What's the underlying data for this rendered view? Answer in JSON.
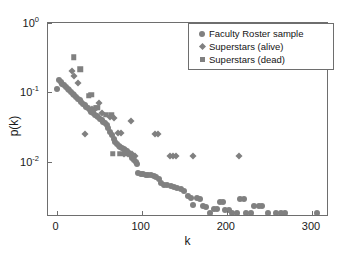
{
  "chart_data": {
    "type": "scatter",
    "title": "",
    "xlabel": "k",
    "ylabel": "p(k)",
    "xscale": "linear",
    "yscale": "log",
    "xlim": [
      -10,
      320
    ],
    "ylim": [
      0.0016,
      1.0
    ],
    "grid": false,
    "legend_position": "top-right",
    "xticks": [
      0,
      100,
      200,
      300
    ],
    "xtick_labels": [
      "0",
      "100",
      "200",
      "300"
    ],
    "yticks": [
      1,
      0.1,
      0.01
    ],
    "ytick_labels": [
      "10",
      "10",
      "10"
    ],
    "ytick_exponents": [
      "0",
      "-1",
      "-2"
    ],
    "series": [
      {
        "name": "Faculty Roster sample",
        "marker": "circle",
        "color": "#808080",
        "points": [
          [
            1,
            0.112
          ],
          [
            3,
            0.15
          ],
          [
            5,
            0.139
          ],
          [
            7,
            0.132
          ],
          [
            9,
            0.127
          ],
          [
            11,
            0.12
          ],
          [
            13,
            0.113
          ],
          [
            15,
            0.107
          ],
          [
            17,
            0.101
          ],
          [
            19,
            0.096
          ],
          [
            21,
            0.091
          ],
          [
            23,
            0.086
          ],
          [
            25,
            0.081
          ],
          [
            27,
            0.077
          ],
          [
            29,
            0.073
          ],
          [
            31,
            0.069
          ],
          [
            33,
            0.066
          ],
          [
            35,
            0.062
          ],
          [
            37,
            0.059
          ],
          [
            39,
            0.056
          ],
          [
            41,
            0.053
          ],
          [
            43,
            0.051
          ],
          [
            45,
            0.048
          ],
          [
            47,
            0.046
          ],
          [
            49,
            0.044
          ],
          [
            51,
            0.042
          ],
          [
            53,
            0.04
          ],
          [
            55,
            0.038
          ],
          [
            57,
            0.036
          ],
          [
            59,
            0.034
          ],
          [
            61,
            0.031
          ],
          [
            63,
            0.027
          ],
          [
            65,
            0.024
          ],
          [
            67,
            0.021
          ],
          [
            69,
            0.019
          ],
          [
            71,
            0.018
          ],
          [
            73,
            0.017
          ],
          [
            75,
            0.0165
          ],
          [
            77,
            0.016
          ],
          [
            79,
            0.0155
          ],
          [
            81,
            0.015
          ],
          [
            83,
            0.0145
          ],
          [
            85,
            0.0135
          ],
          [
            87,
            0.0125
          ],
          [
            89,
            0.0115
          ],
          [
            91,
            0.0105
          ],
          [
            93,
            0.0098
          ],
          [
            95,
            0.0092
          ],
          [
            96,
            0.0068
          ],
          [
            99,
            0.0066
          ],
          [
            102,
            0.0066
          ],
          [
            105,
            0.0065
          ],
          [
            108,
            0.0065
          ],
          [
            111,
            0.0064
          ],
          [
            114,
            0.0063
          ],
          [
            117,
            0.006
          ],
          [
            120,
            0.0056
          ],
          [
            123,
            0.005
          ],
          [
            126,
            0.0047
          ],
          [
            130,
            0.0046
          ],
          [
            134,
            0.0045
          ],
          [
            138,
            0.0044
          ],
          [
            142,
            0.0042
          ],
          [
            146,
            0.004
          ],
          [
            150,
            0.0038
          ],
          [
            154,
            0.0032
          ],
          [
            158,
            0.003
          ],
          [
            160,
            0.0024
          ],
          [
            165,
            0.003
          ],
          [
            168,
            0.0029
          ],
          [
            172,
            0.0023
          ],
          [
            176,
            0.0022
          ],
          [
            180,
            0.0018
          ],
          [
            185,
            0.0021
          ],
          [
            188,
            0.0021
          ],
          [
            192,
            0.0026
          ],
          [
            195,
            0.0026
          ],
          [
            198,
            0.002
          ],
          [
            202,
            0.002
          ],
          [
            206,
            0.0018
          ],
          [
            212,
            0.0018
          ],
          [
            216,
            0.0029
          ],
          [
            220,
            0.0029
          ],
          [
            222,
            0.0018
          ],
          [
            228,
            0.0018
          ],
          [
            232,
            0.0023
          ],
          [
            238,
            0.0023
          ],
          [
            241,
            0.0023
          ],
          [
            248,
            0.0018
          ],
          [
            258,
            0.0018
          ],
          [
            264,
            0.0018
          ],
          [
            268,
            0.0018
          ],
          [
            306,
            0.0018
          ]
        ]
      },
      {
        "name": "Superstars (alive)",
        "marker": "diamond",
        "color": "#808080",
        "points": [
          [
            18,
            0.205
          ],
          [
            20,
            0.175
          ],
          [
            25,
            0.138
          ],
          [
            33,
            0.025
          ],
          [
            42,
            0.058
          ],
          [
            44,
            0.056
          ],
          [
            50,
            0.07
          ],
          [
            53,
            0.05
          ],
          [
            63,
            0.044
          ],
          [
            67,
            0.043
          ],
          [
            72,
            0.026
          ],
          [
            76,
            0.026
          ],
          [
            79,
            0.013
          ],
          [
            84,
            0.013
          ],
          [
            87,
            0.039
          ],
          [
            89,
            0.013
          ],
          [
            92,
            0.012
          ],
          [
            116,
            0.025
          ],
          [
            119,
            0.025
          ],
          [
            133,
            0.012
          ],
          [
            137,
            0.012
          ],
          [
            140,
            0.012
          ],
          [
            160,
            0.012
          ],
          [
            214,
            0.012
          ]
        ]
      },
      {
        "name": "Superstars (dead)",
        "marker": "square",
        "color": "#808080",
        "points": [
          [
            20,
            0.32
          ],
          [
            28,
            0.215
          ],
          [
            38,
            0.09
          ],
          [
            41,
            0.092
          ],
          [
            46,
            0.06
          ],
          [
            48,
            0.06
          ],
          [
            58,
            0.048
          ],
          [
            64,
            0.048
          ],
          [
            66,
            0.013
          ],
          [
            75,
            0.013
          ],
          [
            82,
            0.013
          ]
        ]
      }
    ]
  },
  "legend": {
    "entries": [
      {
        "label": "Faculty Roster sample",
        "symbol": "circle"
      },
      {
        "label": "Superstars (alive)",
        "symbol": "diamond"
      },
      {
        "label": "Superstars (dead)",
        "symbol": "square"
      }
    ]
  }
}
